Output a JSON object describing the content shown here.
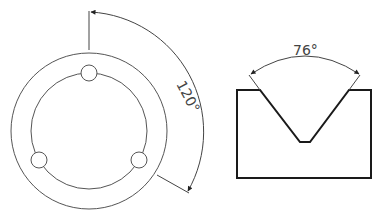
{
  "figure_left": {
    "name": "circular-plate-with-three-holes",
    "outer_circle": {
      "cx": 89,
      "cy": 131,
      "r": 78
    },
    "inner_circle": {
      "cx": 89,
      "cy": 131,
      "r": 58
    },
    "holes": [
      {
        "cx": 89,
        "cy": 73,
        "r": 8
      },
      {
        "cx": 39,
        "cy": 160,
        "r": 8
      },
      {
        "cx": 139,
        "cy": 160,
        "r": 8
      }
    ],
    "angle_dimension": {
      "label": "120°",
      "value": 120
    }
  },
  "figure_right": {
    "name": "v-block",
    "angle_dimension": {
      "label": "76°",
      "value": 76
    }
  },
  "colors": {
    "line": "#555555",
    "thick_line": "#1a1a1a",
    "background": "#ffffff"
  }
}
